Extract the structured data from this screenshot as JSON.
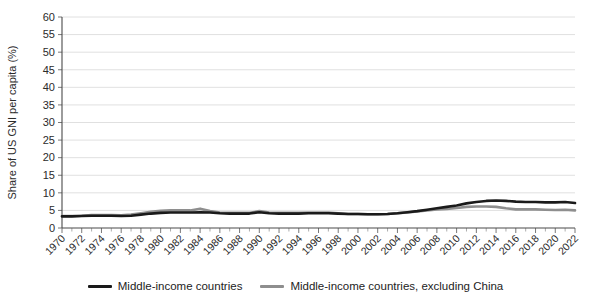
{
  "chart_data": {
    "type": "line",
    "title": "",
    "xlabel": "",
    "ylabel": "Share of US GNI per capita (%)",
    "ylim": [
      0,
      60
    ],
    "ytick_step": 5,
    "yticks": [
      0,
      5,
      10,
      15,
      20,
      25,
      30,
      35,
      40,
      45,
      50,
      55,
      60
    ],
    "ytick_labels": [
      "0",
      "5",
      "10",
      "15",
      "20",
      "25",
      "30",
      "35",
      "40",
      "45",
      "50",
      "55",
      "60"
    ],
    "xlim": [
      1970,
      2022
    ],
    "xtick_step": 2,
    "x": [
      1970,
      1971,
      1972,
      1973,
      1974,
      1975,
      1976,
      1977,
      1978,
      1979,
      1980,
      1981,
      1982,
      1983,
      1984,
      1985,
      1986,
      1987,
      1988,
      1989,
      1990,
      1991,
      1992,
      1993,
      1994,
      1995,
      1996,
      1997,
      1998,
      1999,
      2000,
      2001,
      2002,
      2003,
      2004,
      2005,
      2006,
      2007,
      2008,
      2009,
      2010,
      2011,
      2012,
      2013,
      2014,
      2015,
      2016,
      2017,
      2018,
      2019,
      2020,
      2021,
      2022
    ],
    "xtick_labels": [
      "1970",
      "1972",
      "1974",
      "1976",
      "1978",
      "1980",
      "1982",
      "1984",
      "1986",
      "1988",
      "1990",
      "1992",
      "1994",
      "1996",
      "1998",
      "2000",
      "2002",
      "2004",
      "2006",
      "2008",
      "2010",
      "2012",
      "2014",
      "2016",
      "2018",
      "2020",
      "2022"
    ],
    "grid": true,
    "grid_axis": "y",
    "legend_position": "bottom",
    "series": [
      {
        "name": "Middle-income countries",
        "color": "#1a1a1a",
        "width": 2.6,
        "values": [
          3.3,
          3.3,
          3.4,
          3.5,
          3.5,
          3.5,
          3.4,
          3.5,
          3.8,
          4.1,
          4.3,
          4.4,
          4.4,
          4.4,
          4.5,
          4.4,
          4.2,
          4.1,
          4.1,
          4.1,
          4.5,
          4.2,
          4.1,
          4.1,
          4.1,
          4.2,
          4.2,
          4.2,
          4.1,
          4.0,
          4.0,
          3.9,
          3.9,
          4.0,
          4.2,
          4.5,
          4.8,
          5.2,
          5.6,
          6.0,
          6.4,
          7.0,
          7.4,
          7.7,
          7.8,
          7.7,
          7.5,
          7.4,
          7.4,
          7.3,
          7.3,
          7.4,
          7.1
        ]
      },
      {
        "name": "Middle-income countries, excluding China",
        "color": "#8e8e8e",
        "width": 2.6,
        "values": [
          3.4,
          3.4,
          3.5,
          3.7,
          3.7,
          3.7,
          3.6,
          3.8,
          4.2,
          4.6,
          4.9,
          5.0,
          5.0,
          5.0,
          5.5,
          4.8,
          4.4,
          4.3,
          4.3,
          4.3,
          4.8,
          4.4,
          4.3,
          4.3,
          4.3,
          4.4,
          4.4,
          4.4,
          4.2,
          4.0,
          4.0,
          3.9,
          3.9,
          4.0,
          4.2,
          4.4,
          4.7,
          5.0,
          5.3,
          5.4,
          5.7,
          6.0,
          6.1,
          6.1,
          6.0,
          5.6,
          5.3,
          5.3,
          5.3,
          5.2,
          5.1,
          5.2,
          5.0
        ]
      }
    ]
  },
  "legend": {
    "items": [
      {
        "label": "Middle-income countries",
        "color": "#1a1a1a"
      },
      {
        "label": "Middle-income countries, excluding China",
        "color": "#8e8e8e"
      }
    ]
  }
}
